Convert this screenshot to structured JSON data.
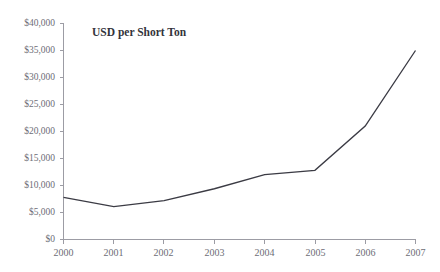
{
  "page": {
    "clipped_header_fragment": "",
    "background_color": "#ffffff"
  },
  "chart_data": {
    "type": "line",
    "title": "USD per Short Ton",
    "title_position": "inside-top-left",
    "xlabel": "",
    "ylabel": "",
    "x": [
      "2000",
      "2001",
      "2002",
      "2003",
      "2004",
      "2005",
      "2006",
      "2007"
    ],
    "categories": [
      "2000",
      "2001",
      "2002",
      "2003",
      "2004",
      "2005",
      "2006",
      "2007"
    ],
    "values": [
      7800,
      6100,
      7200,
      9400,
      12000,
      12800,
      21000,
      35000
    ],
    "series": [
      {
        "name": "USD per Short Ton",
        "values": [
          7800,
          6100,
          7200,
          9400,
          12000,
          12800,
          21000,
          35000
        ],
        "color": "#3b3b44"
      }
    ],
    "ylim": [
      0,
      40000
    ],
    "ytick_values": [
      0,
      5000,
      10000,
      15000,
      20000,
      25000,
      30000,
      35000,
      40000
    ],
    "ytick_labels": [
      "$0",
      "$5,000",
      "$10,000",
      "$15,000",
      "$20,000",
      "$25,000",
      "$30,000",
      "$35,000",
      "$40,000"
    ],
    "xtick_labels": [
      "2000",
      "2001",
      "2002",
      "2003",
      "2004",
      "2005",
      "2006",
      "2007"
    ],
    "grid": false,
    "legend": false,
    "legend_position": "none",
    "axis_color": "#9c9ca4",
    "line_color": "#3b3b44",
    "annotations": []
  }
}
